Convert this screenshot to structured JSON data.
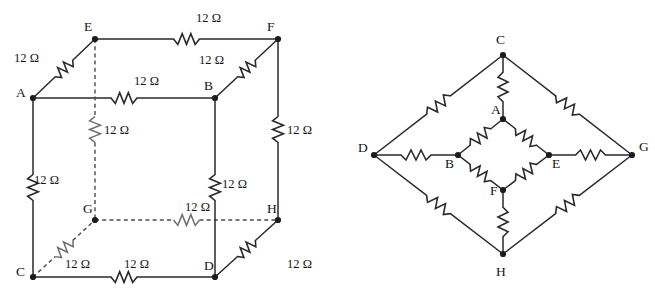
{
  "figure": {
    "background_color": "#ffffff",
    "line_color": "#2a2a2e",
    "dashed_line_color": "#4a4a50",
    "node_color": "#1c1c20",
    "resistance_value": "12 Ω",
    "resistance_number": 12,
    "resistance_unit": "Ω",
    "resistor_count": 12
  },
  "left_diagram": {
    "name": "cube-network",
    "nodes": [
      {
        "id": "A",
        "label": "A",
        "x": 33,
        "y": 98,
        "label_x": 16,
        "label_y": 97,
        "hidden": false
      },
      {
        "id": "B",
        "label": "B",
        "x": 215,
        "y": 98,
        "label_x": 204,
        "label_y": 90,
        "hidden": false
      },
      {
        "id": "C",
        "label": "C",
        "x": 33,
        "y": 277,
        "label_x": 16,
        "label_y": 276,
        "hidden": false
      },
      {
        "id": "D",
        "label": "D",
        "x": 215,
        "y": 277,
        "label_x": 204,
        "label_y": 270,
        "hidden": false
      },
      {
        "id": "E",
        "label": "E",
        "x": 95,
        "y": 39,
        "label_x": 84,
        "label_y": 31,
        "hidden": false
      },
      {
        "id": "F",
        "label": "F",
        "x": 278,
        "y": 39,
        "label_x": 267,
        "label_y": 31,
        "hidden": false
      },
      {
        "id": "G",
        "label": "G",
        "x": 95,
        "y": 220,
        "label_x": 83,
        "label_y": 213,
        "hidden": true
      },
      {
        "id": "H",
        "label": "H",
        "x": 278,
        "y": 220,
        "label_x": 267,
        "label_y": 213,
        "hidden": false
      }
    ],
    "edges": [
      {
        "from": "A",
        "to": "B",
        "label": "12 Ω",
        "label_x": 134,
        "label_y": 85,
        "dashed": false,
        "orientation": "horizontal"
      },
      {
        "from": "E",
        "to": "F",
        "label": "12 Ω",
        "label_x": 196,
        "label_y": 22,
        "dashed": false,
        "orientation": "horizontal"
      },
      {
        "from": "C",
        "to": "D",
        "label": "12 Ω",
        "label_x": 124,
        "label_y": 268,
        "dashed": false,
        "orientation": "horizontal"
      },
      {
        "from": "G",
        "to": "H",
        "label": "12 Ω",
        "label_x": 185,
        "label_y": 211,
        "dashed": true,
        "orientation": "horizontal"
      },
      {
        "from": "A",
        "to": "C",
        "label": "12 Ω",
        "label_x": 34,
        "label_y": 184,
        "dashed": false,
        "orientation": "vertical"
      },
      {
        "from": "B",
        "to": "D",
        "label": "12 Ω",
        "label_x": 222,
        "label_y": 188,
        "dashed": false,
        "orientation": "vertical"
      },
      {
        "from": "F",
        "to": "H",
        "label": "12 Ω",
        "label_x": 287,
        "label_y": 134,
        "dashed": false,
        "orientation": "vertical"
      },
      {
        "from": "E",
        "to": "G",
        "label": "12 Ω",
        "label_x": 104,
        "label_y": 134,
        "dashed": true,
        "orientation": "vertical"
      },
      {
        "from": "A",
        "to": "E",
        "label": "12 Ω",
        "label_x": 14,
        "label_y": 62,
        "dashed": false,
        "orientation": "diagonal"
      },
      {
        "from": "B",
        "to": "F",
        "label": "12 Ω",
        "label_x": 199,
        "label_y": 64,
        "dashed": false,
        "orientation": "diagonal"
      },
      {
        "from": "C",
        "to": "G",
        "label": "12 Ω",
        "label_x": 65,
        "label_y": 268,
        "dashed": true,
        "orientation": "diagonal"
      },
      {
        "from": "D",
        "to": "H",
        "label": "12 Ω",
        "label_x": 287,
        "label_y": 268,
        "dashed": false,
        "orientation": "diagonal"
      }
    ]
  },
  "right_diagram": {
    "name": "planar-equivalent-network",
    "nodes": [
      {
        "id": "C",
        "label": "C",
        "x": 503,
        "y": 55,
        "label_x": 496,
        "label_y": 44
      },
      {
        "id": "D",
        "label": "D",
        "x": 374,
        "y": 155,
        "label_x": 358,
        "label_y": 152
      },
      {
        "id": "G",
        "label": "G",
        "x": 632,
        "y": 155,
        "label_x": 639,
        "label_y": 151
      },
      {
        "id": "H",
        "label": "H",
        "x": 503,
        "y": 254,
        "label_x": 496,
        "label_y": 276
      },
      {
        "id": "A",
        "label": "A",
        "x": 503,
        "y": 119,
        "label_x": 491,
        "label_y": 114
      },
      {
        "id": "B",
        "label": "B",
        "x": 458,
        "y": 155,
        "label_x": 445,
        "label_y": 168
      },
      {
        "id": "E",
        "label": "E",
        "x": 549,
        "y": 155,
        "label_x": 552,
        "label_y": 168
      },
      {
        "id": "F",
        "label": "F",
        "x": 503,
        "y": 190,
        "label_x": 490,
        "label_y": 195
      }
    ],
    "edges": [
      {
        "from": "C",
        "to": "D",
        "label": "12 Ω"
      },
      {
        "from": "C",
        "to": "G",
        "label": "12 Ω"
      },
      {
        "from": "D",
        "to": "H",
        "label": "12 Ω"
      },
      {
        "from": "G",
        "to": "H",
        "label": "12 Ω"
      },
      {
        "from": "C",
        "to": "A",
        "label": "12 Ω"
      },
      {
        "from": "D",
        "to": "B",
        "label": "12 Ω"
      },
      {
        "from": "G",
        "to": "E",
        "label": "12 Ω"
      },
      {
        "from": "H",
        "to": "F",
        "label": "12 Ω"
      },
      {
        "from": "A",
        "to": "B",
        "label": "12 Ω"
      },
      {
        "from": "A",
        "to": "E",
        "label": "12 Ω"
      },
      {
        "from": "B",
        "to": "F",
        "label": "12 Ω"
      },
      {
        "from": "E",
        "to": "F",
        "label": "12 Ω"
      }
    ]
  }
}
